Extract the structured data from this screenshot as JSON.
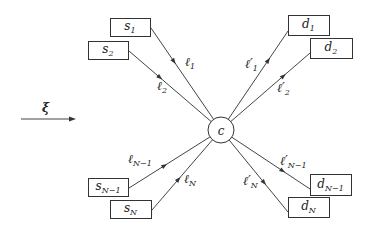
{
  "diagram": {
    "title": "",
    "flow_label": "ξ",
    "center": {
      "label": "c",
      "x": 221,
      "y": 130,
      "r": 13
    },
    "sources": [
      {
        "id": "s1",
        "base": "s",
        "sub": "1",
        "x": 110,
        "y": 18,
        "w": 40,
        "h": 18,
        "attach": [
          151,
          28
        ],
        "link": {
          "base": "ℓ",
          "prime": "",
          "sub": "1",
          "lx": 185,
          "ly": 66,
          "ax": 176,
          "ay": 60
        }
      },
      {
        "id": "s2",
        "base": "s",
        "sub": "2",
        "x": 88,
        "y": 41,
        "w": 40,
        "h": 18,
        "attach": [
          129,
          51
        ],
        "link": {
          "base": "ℓ",
          "prime": "",
          "sub": "2",
          "lx": 157,
          "ly": 90,
          "ax": 163,
          "ay": 74
        }
      },
      {
        "id": "sN-1",
        "base": "s",
        "sub": "N−1",
        "x": 88,
        "y": 178,
        "w": 40,
        "h": 18,
        "attach": [
          129,
          188
        ],
        "link": {
          "base": "ℓ",
          "prime": "",
          "sub": "N−1",
          "lx": 128,
          "ly": 163,
          "ax": 163,
          "ay": 163
        }
      },
      {
        "id": "sN",
        "base": "s",
        "sub": "N",
        "x": 110,
        "y": 200,
        "w": 41,
        "h": 18,
        "attach": [
          152,
          210
        ],
        "link": {
          "base": "ℓ",
          "prime": "",
          "sub": "N",
          "lx": 184,
          "ly": 183,
          "ax": 177,
          "ay": 178
        }
      }
    ],
    "destinations": [
      {
        "id": "d1",
        "base": "d",
        "sub": "1",
        "x": 288,
        "y": 15,
        "w": 41,
        "h": 20,
        "attach": [
          288,
          31
        ],
        "link": {
          "base": "ℓ",
          "prime": "′",
          "sub": "1",
          "lx": 245,
          "ly": 68,
          "ax": 265,
          "ay": 58
        }
      },
      {
        "id": "d2",
        "base": "d",
        "sub": "2",
        "x": 310,
        "y": 38,
        "w": 42,
        "h": 20,
        "attach": [
          310,
          53
        ],
        "link": {
          "base": "ℓ",
          "prime": "′",
          "sub": "2",
          "lx": 277,
          "ly": 92,
          "ax": 281,
          "ay": 73
        }
      },
      {
        "id": "dN-1",
        "base": "d",
        "sub": "N−1",
        "x": 310,
        "y": 174,
        "w": 41,
        "h": 21,
        "attach": [
          310,
          189
        ],
        "link": {
          "base": "ℓ",
          "prime": "′",
          "sub": "N−1",
          "lx": 280,
          "ly": 165,
          "ax": 282,
          "ay": 172
        }
      },
      {
        "id": "dN",
        "base": "d",
        "sub": "N",
        "x": 288,
        "y": 197,
        "w": 41,
        "h": 20,
        "attach": [
          288,
          212
        ],
        "link": {
          "base": "ℓ",
          "prime": "′",
          "sub": "N",
          "lx": 243,
          "ly": 185,
          "ax": 265,
          "ay": 182
        }
      }
    ]
  }
}
